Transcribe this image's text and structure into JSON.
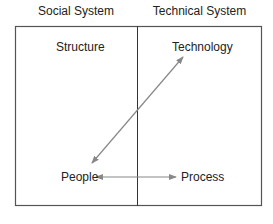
{
  "diagram": {
    "headers": {
      "left": "Social System",
      "right": "Technical System"
    },
    "nodes": {
      "structure": "Structure",
      "technology": "Technology",
      "people": "People",
      "process": "Process"
    },
    "edges": [
      {
        "from": "People",
        "to": "Technology",
        "type": "bidirectional"
      },
      {
        "from": "People",
        "to": "Process",
        "type": "bidirectional"
      }
    ],
    "colors": {
      "border": "#555555",
      "arrow": "#888888",
      "text": "#222222"
    }
  }
}
